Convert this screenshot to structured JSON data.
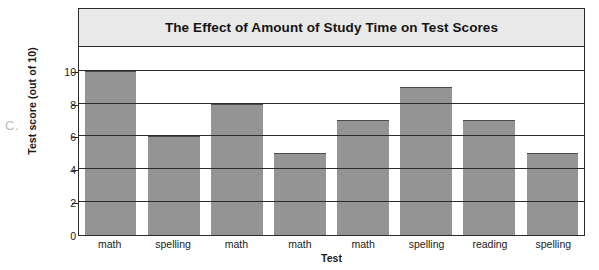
{
  "figure_label": "C.",
  "chart_data": {
    "type": "bar",
    "title": "The Effect of Amount of Study Time on Test Scores",
    "xlabel": "Test",
    "ylabel": "Test score (out of 10)",
    "categories": [
      "math",
      "spelling",
      "math",
      "math",
      "math",
      "spelling",
      "reading",
      "spelling"
    ],
    "values": [
      10,
      6,
      8,
      5,
      7,
      9,
      7,
      5
    ],
    "yticks": [
      0,
      2,
      4,
      6,
      8,
      10
    ],
    "ytick_labels": [
      "0",
      "2",
      "4",
      "6",
      "8",
      "10"
    ],
    "ylim": [
      0,
      11.5
    ],
    "grid": true,
    "legend": null,
    "bar_color": "#949494",
    "title_band_color": "#e9e9e9",
    "frame_color": "#2b2b2b"
  }
}
